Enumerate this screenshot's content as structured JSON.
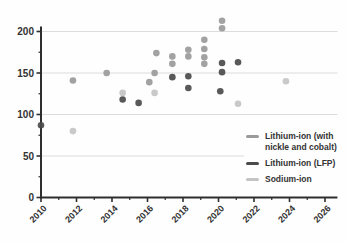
{
  "chart_data": {
    "type": "scatter",
    "title": "",
    "xlabel": "",
    "ylabel": "",
    "xlim": [
      2010,
      2026.7
    ],
    "ylim": [
      0,
      206
    ],
    "x_major_ticks": [
      2010,
      2012,
      2014,
      2016,
      2018,
      2020,
      2022,
      2024,
      2026
    ],
    "x_minor_ticks": [
      2011,
      2013,
      2015,
      2017,
      2019,
      2021,
      2023,
      2025
    ],
    "x_tick_labels": [
      "2010",
      "2012",
      "2014",
      "2016",
      "2018",
      "2020",
      "2022",
      "2024",
      "2026"
    ],
    "y_major_ticks": [
      0,
      50,
      100,
      150,
      200
    ],
    "y_minor_ticks": [
      25,
      75,
      125,
      175
    ],
    "y_tick_labels": [
      "0",
      "50",
      "100",
      "150",
      "200"
    ],
    "grid_values": [
      50,
      100,
      150,
      200
    ],
    "grid_on": true,
    "legend_position": "right-middle",
    "series": [
      {
        "name": "Lithium-ion (with nickle and cobalt)",
        "label_lines": [
          "Lithium-ion (with",
          "nickle and cobalt)"
        ],
        "color": "#9a9a9a",
        "points": [
          [
            2011.8,
            141
          ],
          [
            2013.7,
            150
          ],
          [
            2016.1,
            139
          ],
          [
            2016.4,
            150
          ],
          [
            2016.5,
            174
          ],
          [
            2017.4,
            170
          ],
          [
            2017.4,
            161
          ],
          [
            2018.3,
            178
          ],
          [
            2018.3,
            170
          ],
          [
            2019.2,
            190
          ],
          [
            2019.2,
            179
          ],
          [
            2019.2,
            169
          ],
          [
            2019.2,
            161
          ],
          [
            2020.2,
            213
          ],
          [
            2020.2,
            204
          ]
        ]
      },
      {
        "name": "Lithium-ion (LFP)",
        "label_lines": [
          "Lithium-ion (LFP)"
        ],
        "color": "#4b4b4b",
        "points": [
          [
            2010.0,
            87
          ],
          [
            2014.6,
            118
          ],
          [
            2015.5,
            114
          ],
          [
            2017.4,
            145
          ],
          [
            2018.3,
            146
          ],
          [
            2018.3,
            132
          ],
          [
            2020.1,
            128
          ],
          [
            2020.2,
            151
          ],
          [
            2020.2,
            162
          ],
          [
            2021.1,
            163
          ]
        ]
      },
      {
        "name": "Sodium-ion",
        "label_lines": [
          "Sodium-ion"
        ],
        "color": "#c4c4c4",
        "points": [
          [
            2011.8,
            80
          ],
          [
            2014.6,
            126
          ],
          [
            2016.4,
            126
          ],
          [
            2021.1,
            113
          ],
          [
            2023.8,
            140
          ]
        ]
      }
    ]
  },
  "colors": {
    "background": "#fefefe",
    "axis": "#2e2e2e",
    "grid": "#dcdcdc",
    "tick_text": "#333333",
    "legend_text": "#333333"
  }
}
